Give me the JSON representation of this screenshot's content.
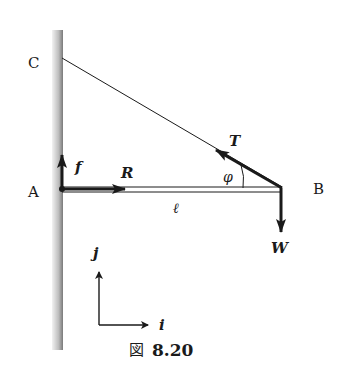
{
  "figure": {
    "caption_prefix": "図",
    "caption_number": "8.20"
  },
  "points": {
    "C": "C",
    "A": "A",
    "B": "B"
  },
  "forces": {
    "f": "f",
    "R": "R",
    "T": "T",
    "W": "W"
  },
  "symbols": {
    "angle": "φ",
    "length": "ℓ"
  },
  "axes": {
    "i": "i",
    "j": "j"
  },
  "colors": {
    "ink": "#1a1a1a",
    "wall_light": "#e6e6e6",
    "wall_dark": "#8a8a8a"
  }
}
